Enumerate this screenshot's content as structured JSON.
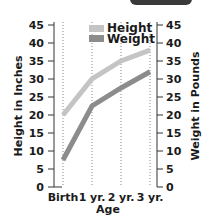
{
  "chart_data": {
    "type": "line",
    "title": "",
    "xlabel": "Age",
    "ylabel": "Height in Inches",
    "ylabel_right": "Weight in Pounds",
    "categories": [
      "Birth",
      "1 yr.",
      "2 yr.",
      "3 yr."
    ],
    "series": [
      {
        "name": "Height",
        "values": [
          20,
          30,
          35,
          38
        ],
        "color": "#c4c4c4",
        "axis": "left"
      },
      {
        "name": "Weight",
        "values": [
          7.5,
          22.5,
          27.5,
          32
        ],
        "color": "#8c8c8c",
        "axis": "right"
      }
    ],
    "ylim": [
      0,
      45
    ],
    "yticks": [
      0,
      5,
      10,
      15,
      20,
      25,
      30,
      35,
      40,
      45
    ],
    "ylim_right": [
      0,
      45
    ],
    "yticks_right": [
      0,
      5,
      10,
      15,
      20,
      25,
      30,
      35,
      40,
      45
    ],
    "grid": "vertical dotted lines at each category",
    "legend_position": "top-center-inside"
  },
  "legend": {
    "height_label": "Height",
    "weight_label": "Weight"
  },
  "axes": {
    "left_title": "Height in Inches",
    "right_title": "Weight in Pounds",
    "x_title": "Age"
  }
}
